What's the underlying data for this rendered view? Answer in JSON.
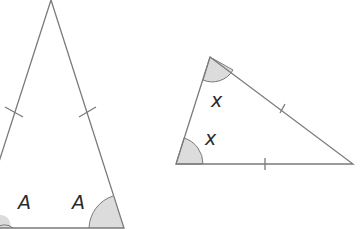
{
  "diagram": {
    "isosceles_triangle": {
      "angle_labels": [
        "A",
        "A"
      ],
      "equal_side_marks": 2
    },
    "scalene_like_triangle": {
      "angle_labels": [
        "x",
        "x"
      ],
      "equal_side_marks": 2
    },
    "colors": {
      "stroke": "#7a7a7a",
      "angle_fill": "#dcdcdc",
      "text": "#2a2a2a"
    }
  }
}
